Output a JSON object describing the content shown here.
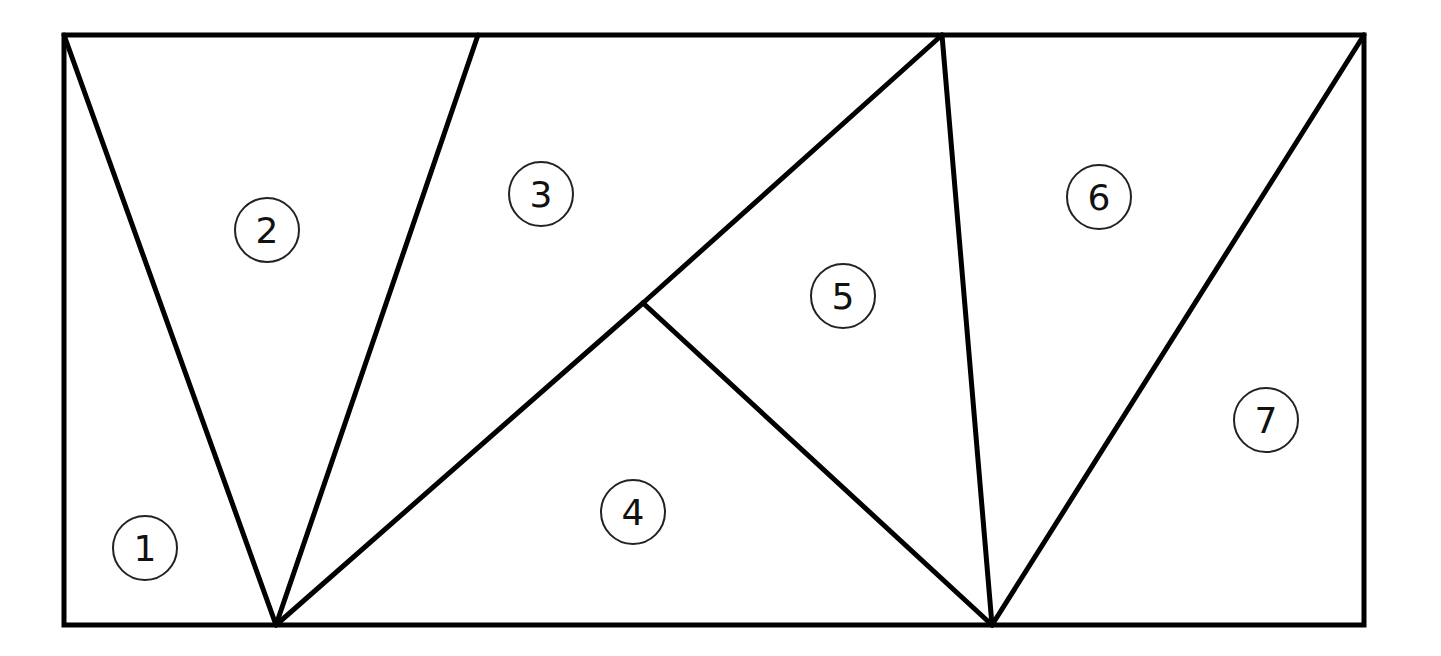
{
  "diagram": {
    "colors": {
      "stroke": "#000000",
      "background": "#ffffff",
      "label_circle": "#222222"
    },
    "rectangle": {
      "x": 64,
      "y": 35,
      "width": 1300,
      "height": 590
    },
    "vertices": {
      "A": [
        64,
        35
      ],
      "B": [
        478,
        35
      ],
      "C": [
        942,
        35
      ],
      "D": [
        1364,
        35
      ],
      "E": [
        276,
        625
      ],
      "F": [
        992,
        625
      ],
      "G": [
        643,
        303
      ],
      "H": [
        64,
        625
      ],
      "I": [
        1364,
        625
      ]
    },
    "segments": [
      {
        "from": "A",
        "to": "E"
      },
      {
        "from": "B",
        "to": "E"
      },
      {
        "from": "E",
        "to": "G"
      },
      {
        "from": "G",
        "to": "C"
      },
      {
        "from": "G",
        "to": "F"
      },
      {
        "from": "C",
        "to": "F"
      },
      {
        "from": "D",
        "to": "F"
      }
    ],
    "regions": [
      {
        "id": "1",
        "label": "1",
        "cx": 145,
        "cy": 548
      },
      {
        "id": "2",
        "label": "2",
        "cx": 267,
        "cy": 230
      },
      {
        "id": "3",
        "label": "3",
        "cx": 541,
        "cy": 194
      },
      {
        "id": "4",
        "label": "4",
        "cx": 633,
        "cy": 512
      },
      {
        "id": "5",
        "label": "5",
        "cx": 843,
        "cy": 296
      },
      {
        "id": "6",
        "label": "6",
        "cx": 1099,
        "cy": 197
      },
      {
        "id": "7",
        "label": "7",
        "cx": 1266,
        "cy": 420
      }
    ]
  }
}
